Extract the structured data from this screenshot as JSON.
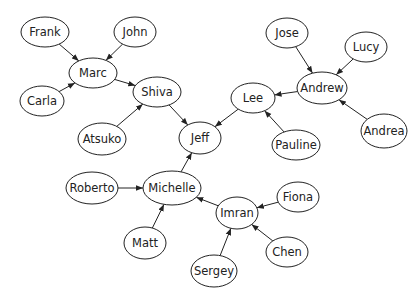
{
  "diagram": {
    "type": "directed-graph",
    "nodes": [
      {
        "id": "Frank",
        "label": "Frank",
        "x": 45,
        "y": 32,
        "rx": 24,
        "ry": 15
      },
      {
        "id": "John",
        "label": "John",
        "x": 135,
        "y": 32,
        "rx": 21,
        "ry": 15
      },
      {
        "id": "Marc",
        "label": "Marc",
        "x": 93,
        "y": 73,
        "rx": 24,
        "ry": 15
      },
      {
        "id": "Carla",
        "label": "Carla",
        "x": 42,
        "y": 101,
        "rx": 22,
        "ry": 15
      },
      {
        "id": "Shiva",
        "label": "Shiva",
        "x": 157,
        "y": 92,
        "rx": 24,
        "ry": 15
      },
      {
        "id": "Atsuko",
        "label": "Atsuko",
        "x": 102,
        "y": 139,
        "rx": 24,
        "ry": 16
      },
      {
        "id": "Jeff",
        "label": "Jeff",
        "x": 200,
        "y": 138,
        "rx": 21,
        "ry": 16
      },
      {
        "id": "Jose",
        "label": "Jose",
        "x": 287,
        "y": 33,
        "rx": 21,
        "ry": 15
      },
      {
        "id": "Lucy",
        "label": "Lucy",
        "x": 366,
        "y": 47,
        "rx": 21,
        "ry": 15
      },
      {
        "id": "Andrew",
        "label": "Andrew",
        "x": 322,
        "y": 88,
        "rx": 25,
        "ry": 16
      },
      {
        "id": "Lee",
        "label": "Lee",
        "x": 253,
        "y": 98,
        "rx": 22,
        "ry": 15
      },
      {
        "id": "Pauline",
        "label": "Pauline",
        "x": 296,
        "y": 145,
        "rx": 24,
        "ry": 15
      },
      {
        "id": "Andrea",
        "label": "Andrea",
        "x": 384,
        "y": 131,
        "rx": 23,
        "ry": 17
      },
      {
        "id": "Roberto",
        "label": "Roberto",
        "x": 92,
        "y": 188,
        "rx": 26,
        "ry": 16
      },
      {
        "id": "Michelle",
        "label": "Michelle",
        "x": 172,
        "y": 188,
        "rx": 29,
        "ry": 17
      },
      {
        "id": "Imran",
        "label": "Imran",
        "x": 237,
        "y": 213,
        "rx": 21,
        "ry": 16
      },
      {
        "id": "Fiona",
        "label": "Fiona",
        "x": 298,
        "y": 197,
        "rx": 21,
        "ry": 15
      },
      {
        "id": "Matt",
        "label": "Matt",
        "x": 145,
        "y": 243,
        "rx": 21,
        "ry": 16
      },
      {
        "id": "Chen",
        "label": "Chen",
        "x": 287,
        "y": 252,
        "rx": 21,
        "ry": 15
      },
      {
        "id": "Sergey",
        "label": "Sergey",
        "x": 214,
        "y": 271,
        "rx": 23,
        "ry": 16
      }
    ],
    "edges": [
      {
        "from": "Frank",
        "to": "Marc"
      },
      {
        "from": "John",
        "to": "Marc"
      },
      {
        "from": "Carla",
        "to": "Marc"
      },
      {
        "from": "Marc",
        "to": "Shiva"
      },
      {
        "from": "Atsuko",
        "to": "Shiva"
      },
      {
        "from": "Shiva",
        "to": "Jeff"
      },
      {
        "from": "Jose",
        "to": "Andrew"
      },
      {
        "from": "Lucy",
        "to": "Andrew"
      },
      {
        "from": "Andrea",
        "to": "Andrew"
      },
      {
        "from": "Andrew",
        "to": "Lee"
      },
      {
        "from": "Pauline",
        "to": "Lee"
      },
      {
        "from": "Lee",
        "to": "Jeff"
      },
      {
        "from": "Michelle",
        "to": "Jeff"
      },
      {
        "from": "Roberto",
        "to": "Michelle"
      },
      {
        "from": "Matt",
        "to": "Michelle"
      },
      {
        "from": "Imran",
        "to": "Michelle"
      },
      {
        "from": "Fiona",
        "to": "Imran"
      },
      {
        "from": "Chen",
        "to": "Imran"
      },
      {
        "from": "Sergey",
        "to": "Imran"
      }
    ],
    "colors": {
      "stroke": "#222222",
      "fill": "#ffffff",
      "background": "#ffffff"
    }
  }
}
